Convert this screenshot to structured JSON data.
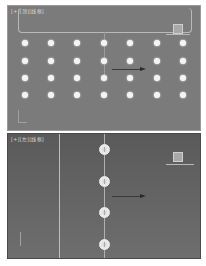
{
  "viewports": {
    "top": {
      "label": "[+][顶][线框]",
      "background": "#7b7b7b",
      "dots": {
        "columns_x": [
          25,
          51,
          77,
          104,
          130,
          157,
          183
        ],
        "rows_y": [
          43,
          61,
          78,
          95
        ],
        "color": "#f4f4f4"
      }
    },
    "left": {
      "label": "[+][左][线框]",
      "background": "#5f5f5f",
      "dots_x": 104,
      "dots_y": [
        149,
        181,
        212,
        244
      ]
    }
  }
}
